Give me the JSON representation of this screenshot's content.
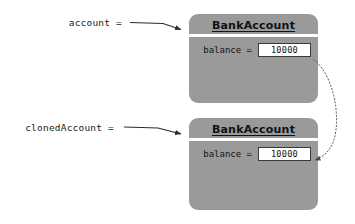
{
  "diagram": {
    "background_color": "#ffffff",
    "box_fill_color": "#9a9a9a",
    "value_box_fill_color": "#ffffff",
    "line_color": "#2b2b2b"
  },
  "references": [
    {
      "id": "account",
      "label": "account =",
      "arrow_name": "account-reference-arrow"
    },
    {
      "id": "clonedAccount",
      "label": "clonedAccount =",
      "arrow_name": "cloned-account-reference-arrow"
    }
  ],
  "objects": [
    {
      "id": "account-object",
      "class_name": "BankAccount",
      "fields": [
        {
          "name": "balance",
          "label": "balance =",
          "value": "10000"
        }
      ]
    },
    {
      "id": "cloned-account-object",
      "class_name": "BankAccount",
      "fields": [
        {
          "name": "balance",
          "label": "balance =",
          "value": "10000"
        }
      ]
    }
  ],
  "connector": {
    "id": "copy-value-connector",
    "style": "dotted-curved-arrow",
    "from": "account-object.balance",
    "to": "cloned-account-object.balance",
    "label": ""
  }
}
